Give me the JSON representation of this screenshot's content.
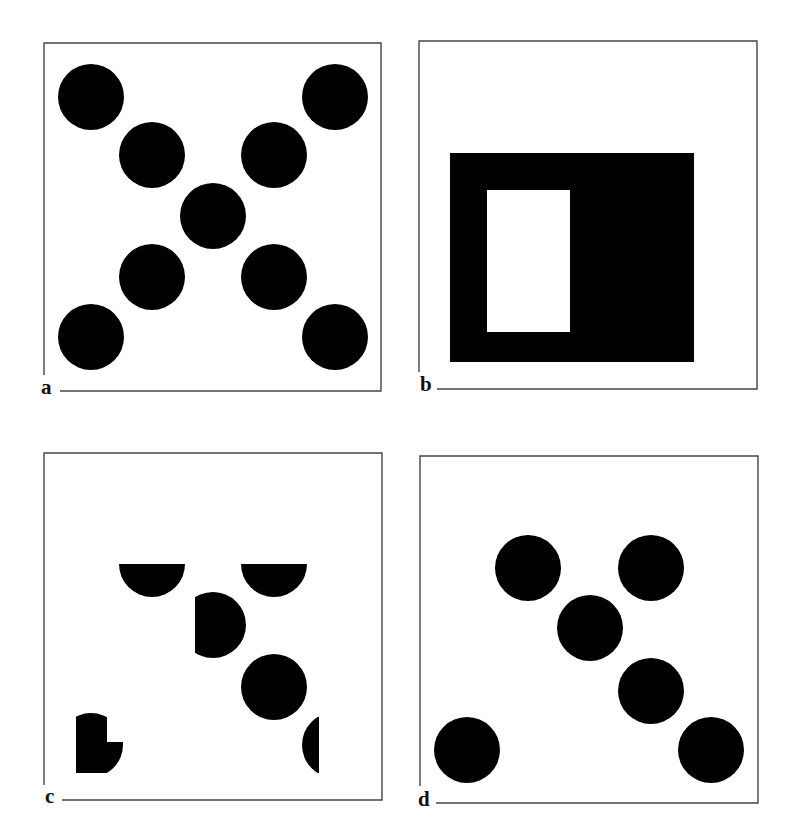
{
  "figure": {
    "width": 788,
    "height": 834,
    "colors": {
      "ink": "#000000",
      "frame": "#444444",
      "background": "#ffffff"
    },
    "panels": [
      {
        "id": "a",
        "label": "a",
        "box": {
          "left": 44,
          "top": 43,
          "right": 381,
          "bottom": 391
        },
        "label_pos": {
          "x": 41,
          "y": 377
        },
        "left_border_end": 375,
        "bottom_line_start": 60,
        "description": "Nine black disks arranged in an X pattern",
        "circles": [
          {
            "cx": 91,
            "cy": 97,
            "r": 33
          },
          {
            "cx": 335,
            "cy": 97,
            "r": 33
          },
          {
            "cx": 152,
            "cy": 155,
            "r": 33
          },
          {
            "cx": 274,
            "cy": 155,
            "r": 33
          },
          {
            "cx": 213,
            "cy": 216,
            "r": 33
          },
          {
            "cx": 152,
            "cy": 277,
            "r": 33
          },
          {
            "cx": 274,
            "cy": 277,
            "r": 33
          },
          {
            "cx": 91,
            "cy": 337,
            "r": 33
          },
          {
            "cx": 335,
            "cy": 337,
            "r": 33
          }
        ],
        "clipped_shapes": []
      },
      {
        "id": "b",
        "label": "b",
        "box": {
          "left": 419,
          "top": 41,
          "right": 757,
          "bottom": 389
        },
        "label_pos": {
          "x": 420,
          "y": 374
        },
        "left_border_end": 372,
        "bottom_line_start": 437,
        "description": "Black rectangular mask with a white rectangular window",
        "rects": [
          {
            "x": 450,
            "y": 153,
            "w": 244,
            "h": 209,
            "fill": "ink"
          },
          {
            "x": 487,
            "y": 190,
            "w": 83,
            "h": 142,
            "fill": "background"
          }
        ],
        "circles": [],
        "clipped_shapes": []
      },
      {
        "id": "c",
        "label": "c",
        "box": {
          "left": 44,
          "top": 453,
          "right": 382,
          "bottom": 800
        },
        "label_pos": {
          "x": 45,
          "y": 786
        },
        "left_border_end": 785,
        "bottom_line_start": 62,
        "description": "Fragments of disks after masking (partial occlusion)",
        "circles": [
          {
            "cx": 274,
            "cy": 687,
            "r": 33
          }
        ],
        "clipped_shapes": [
          {
            "cx": 152,
            "cy": 564,
            "r": 33,
            "clip": {
              "x": 100,
              "y": 564,
              "w": 110,
              "h": 60
            }
          },
          {
            "cx": 274,
            "cy": 564,
            "r": 33,
            "clip": {
              "x": 220,
              "y": 564,
              "w": 110,
              "h": 60
            }
          },
          {
            "cx": 213,
            "cy": 625,
            "r": 33,
            "clip": {
              "x": 195,
              "y": 585,
              "w": 80,
              "h": 90
            }
          },
          {
            "cx": 335,
            "cy": 745,
            "r": 33,
            "clip": {
              "x": 290,
              "y": 717,
              "w": 29,
              "h": 56
            }
          },
          {
            "cx": 91,
            "cy": 745,
            "r": 32,
            "clip": {
              "x": 76,
              "y": 705,
              "w": 31,
              "h": 68
            }
          },
          {
            "cx": 91,
            "cy": 745,
            "r": 32,
            "clip": {
              "x": 100,
              "y": 742,
              "w": 40,
              "h": 31
            }
          }
        ]
      },
      {
        "id": "d",
        "label": "d",
        "box": {
          "left": 420,
          "top": 456,
          "right": 758,
          "bottom": 803
        },
        "label_pos": {
          "x": 418,
          "y": 789
        },
        "left_border_end": 786,
        "bottom_line_start": 436,
        "description": "Six black disks",
        "circles": [
          {
            "cx": 528,
            "cy": 568,
            "r": 33
          },
          {
            "cx": 651,
            "cy": 568,
            "r": 33
          },
          {
            "cx": 590,
            "cy": 628,
            "r": 33
          },
          {
            "cx": 651,
            "cy": 691,
            "r": 33
          },
          {
            "cx": 467,
            "cy": 750,
            "r": 33
          },
          {
            "cx": 711,
            "cy": 750,
            "r": 33
          }
        ],
        "clipped_shapes": []
      }
    ]
  }
}
